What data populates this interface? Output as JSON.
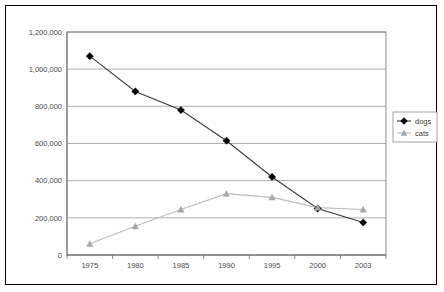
{
  "chart_data": {
    "type": "line",
    "title": "",
    "xlabel": "",
    "ylabel": "",
    "categories": [
      "1975",
      "1980",
      "1985",
      "1990",
      "1995",
      "2000",
      "2003"
    ],
    "ylim": [
      0,
      1200000
    ],
    "ytick_labels": [
      "0",
      "200,000",
      "400,000",
      "600,000",
      "800,000",
      "1,000,000",
      "1,200,000"
    ],
    "ytick_values": [
      0,
      200000,
      400000,
      600000,
      800000,
      1000000,
      1200000
    ],
    "grid": true,
    "legend_position": "right",
    "series": [
      {
        "name": "dogs",
        "marker": "diamond",
        "color": "#000000",
        "line_color": "#3a3a3a",
        "values": [
          1070000,
          880000,
          780000,
          615000,
          420000,
          250000,
          175000
        ]
      },
      {
        "name": "cats",
        "marker": "triangle",
        "color": "#a8a8a8",
        "line_color": "#bdbdbd",
        "values": [
          60000,
          155000,
          245000,
          330000,
          310000,
          255000,
          245000
        ]
      }
    ]
  },
  "legend": {
    "entries": [
      {
        "label": "dogs"
      },
      {
        "label": "cats"
      }
    ]
  },
  "colors": {
    "dogs": "#000000",
    "cats": "#a8a8a8",
    "grid": "#8c8c8c",
    "frame": "#000000",
    "text": "#4a4a4a"
  }
}
